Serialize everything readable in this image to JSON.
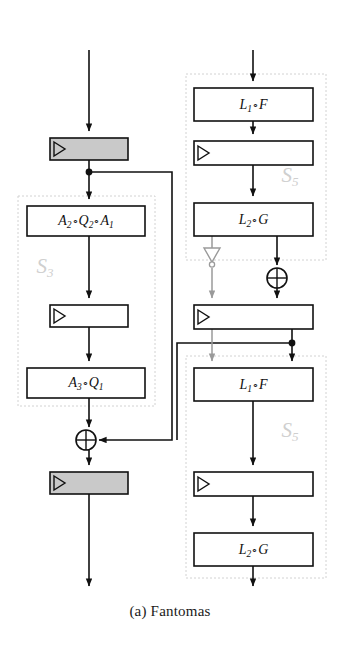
{
  "figure": {
    "caption": "(a) Fantomas"
  },
  "colors": {
    "line": "#111111",
    "gray_line": "#9a9a9a",
    "shaded_box_fill": "#c9c9c9",
    "box_fill": "#ffffff",
    "region_label": "#cfcfcf",
    "region_border": "#d2d2d2",
    "background": "#ffffff"
  },
  "regions": [
    {
      "id": "s3",
      "label": "S",
      "sub": "3",
      "x": 18,
      "y": 196,
      "w": 137,
      "h": 210
    },
    {
      "id": "s5-top",
      "label": "S",
      "sub": "5",
      "x": 186,
      "y": 74,
      "w": 140,
      "h": 186
    },
    {
      "id": "s5-bottom",
      "label": "S",
      "sub": "5",
      "x": 186,
      "y": 356,
      "w": 140,
      "h": 222
    }
  ],
  "blocks": [
    {
      "id": "reg-top-left",
      "kind": "register",
      "shaded": true,
      "label": "",
      "x": 50,
      "y": 138,
      "w": 78,
      "h": 22
    },
    {
      "id": "a2q2a1",
      "kind": "function",
      "shaded": false,
      "label": "A2oQ2oA1",
      "x": 27,
      "y": 206,
      "w": 118,
      "h": 30
    },
    {
      "id": "reg-left-mid",
      "kind": "register",
      "shaded": false,
      "label": "",
      "x": 50,
      "y": 305,
      "w": 78,
      "h": 22
    },
    {
      "id": "a3q1",
      "kind": "function",
      "shaded": false,
      "label": "A3oQ1",
      "x": 27,
      "y": 368,
      "w": 118,
      "h": 30
    },
    {
      "id": "reg-bottom-left",
      "kind": "register",
      "shaded": true,
      "label": "",
      "x": 50,
      "y": 472,
      "w": 78,
      "h": 22
    },
    {
      "id": "l1f-top",
      "kind": "function",
      "shaded": false,
      "label": "L1oF",
      "x": 194,
      "y": 88,
      "w": 119,
      "h": 33
    },
    {
      "id": "reg-right-top",
      "kind": "register",
      "shaded": false,
      "label": "",
      "x": 194,
      "y": 141,
      "w": 119,
      "h": 24
    },
    {
      "id": "l2g-top",
      "kind": "function",
      "shaded": false,
      "label": "L2oG",
      "x": 194,
      "y": 203,
      "w": 119,
      "h": 33
    },
    {
      "id": "reg-right-mid",
      "kind": "register",
      "shaded": false,
      "label": "",
      "x": 194,
      "y": 305,
      "w": 119,
      "h": 24
    },
    {
      "id": "l1f-bottom",
      "kind": "function",
      "shaded": false,
      "label": "L1oF",
      "x": 194,
      "y": 368,
      "w": 119,
      "h": 33
    },
    {
      "id": "reg-right-low",
      "kind": "register",
      "shaded": false,
      "label": "",
      "x": 194,
      "y": 472,
      "w": 119,
      "h": 24
    },
    {
      "id": "l2g-bottom",
      "kind": "function",
      "shaded": false,
      "label": "L2oG",
      "x": 194,
      "y": 533,
      "w": 119,
      "h": 33
    }
  ],
  "block_labels": {
    "l1f": {
      "letter": "L",
      "sub": "1",
      "op": "∘",
      "letter2": "F"
    },
    "l2g": {
      "letter": "L",
      "sub": "2",
      "op": "∘",
      "letter2": "G"
    },
    "a2q2a1": {
      "t1": "A",
      "s1": "2",
      "op1": "∘",
      "t2": "Q",
      "s2": "2",
      "op2": "∘",
      "t3": "A",
      "s3": "1"
    },
    "a3q1": {
      "t1": "A",
      "s1": "3",
      "op1": "∘",
      "t2": "Q",
      "s2": "1"
    }
  },
  "gates": [
    {
      "id": "xor-right",
      "kind": "xor",
      "cx": 277,
      "cy": 278,
      "r": 10
    },
    {
      "id": "xor-left",
      "kind": "xor",
      "cx": 86,
      "cy": 440,
      "r": 10
    },
    {
      "id": "not-gate",
      "kind": "not",
      "cx": 212,
      "cy": 258
    }
  ],
  "junctions": [
    {
      "id": "tap-left-top",
      "cx": 89,
      "cy": 172
    },
    {
      "id": "tap-right-mid",
      "cx": 292,
      "cy": 343
    }
  ],
  "ports": {
    "input_left": {
      "x": 89,
      "y": 50
    },
    "input_right": {
      "x": 253,
      "y": 50
    },
    "output_left": {
      "x": 89,
      "y": 588
    },
    "output_right": {
      "x": 253,
      "y": 588
    }
  }
}
